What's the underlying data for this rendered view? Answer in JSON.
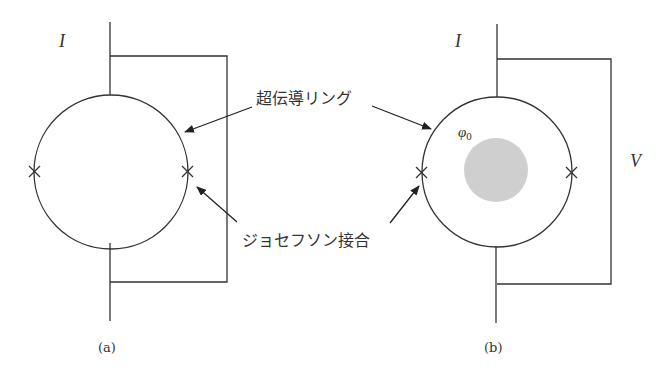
{
  "figure": {
    "panel_a": {
      "caption": "(a)",
      "current_label": "I"
    },
    "panel_b": {
      "caption": "(b)",
      "current_label": "I",
      "voltage_label": "V",
      "flux_label": "φ",
      "flux_subscript": "0"
    },
    "annotations": {
      "ring_label": "超伝導リング",
      "junction_label": "ジョセフソン接合"
    },
    "colors": {
      "line": "#333333",
      "flux_fill": "#cfcfcf",
      "background": "#ffffff"
    }
  }
}
